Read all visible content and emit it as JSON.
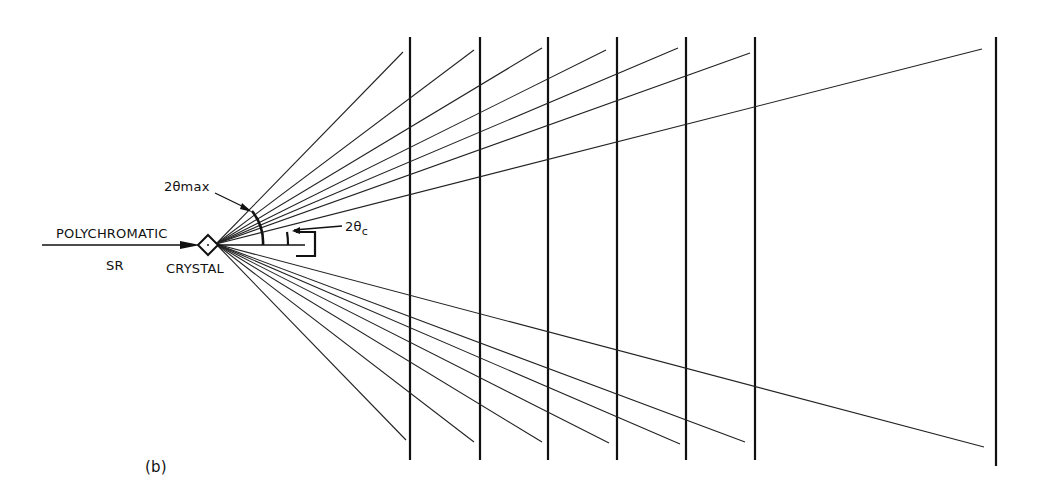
{
  "figure": {
    "panel_label": "(b)",
    "labels": {
      "beam_top": "POLYCHROMATIC",
      "beam_bottom": "SR",
      "crystal": "CRYSTAL",
      "angle_max": "2θmax",
      "angle_c_main": "2θ",
      "angle_c_sub": "c"
    },
    "colors": {
      "ink": "#111111",
      "background": "#ffffff"
    },
    "geometry": {
      "origin": [
        216,
        244
      ],
      "crystal_center": [
        208,
        245
      ],
      "detectors_x": [
        410,
        480,
        548,
        617,
        686,
        755,
        996
      ],
      "detector_top_y": 37,
      "detector_bottom_y": 460,
      "upper_ray_ends": [
        [
          403,
          52
        ],
        [
          474,
          50
        ],
        [
          542,
          48
        ],
        [
          606,
          50
        ],
        [
          678,
          48
        ],
        [
          750,
          53
        ],
        [
          982,
          49
        ]
      ],
      "lower_ray_ends": [
        [
          406,
          440
        ],
        [
          474,
          442
        ],
        [
          542,
          442
        ],
        [
          609,
          443
        ],
        [
          680,
          444
        ],
        [
          745,
          442
        ],
        [
          984,
          447
        ]
      ]
    }
  }
}
